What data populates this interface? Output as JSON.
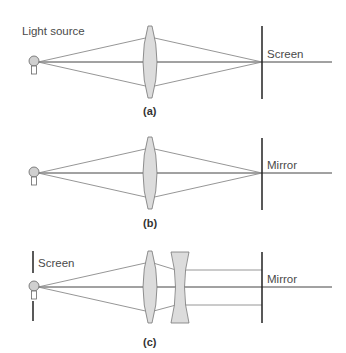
{
  "figure": {
    "panels": [
      {
        "id": "a",
        "caption": "(a)",
        "source_label": "Light source",
        "target_label": "Screen",
        "optics": [
          "convex-lens"
        ]
      },
      {
        "id": "b",
        "caption": "(b)",
        "target_label": "Mirror",
        "optics": [
          "convex-lens"
        ]
      },
      {
        "id": "c",
        "caption": "(c)",
        "source_label": "Screen",
        "target_label": "Mirror",
        "optics": [
          "convex-lens",
          "concave-lens"
        ]
      }
    ]
  },
  "colors": {
    "lens_fill": "#dcdcdc",
    "line": "#555555",
    "ray": "#8a8a8a"
  }
}
